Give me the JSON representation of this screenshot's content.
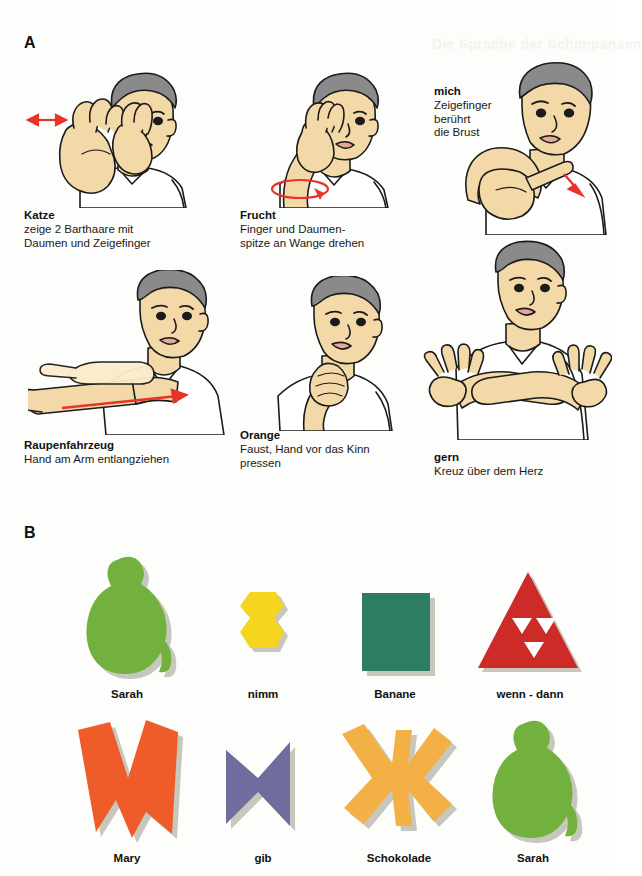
{
  "figure": {
    "panel_a_letter": "A",
    "panel_b_letter": "B",
    "ghost_text": "Die Sprache der Schimpansen"
  },
  "colors": {
    "skin": "#f4d9a8",
    "skin_shadow": "#e8c489",
    "hair": "#8a8a8a",
    "hair_dark": "#6e6e6e",
    "shirt": "#ffffff",
    "outline": "#1b1b1b",
    "arrow_red": "#e8322a",
    "green": "#72b13e",
    "yellow": "#f5d520",
    "teal": "#2e7d62",
    "red": "#cc2b28",
    "orange_red": "#ef5c2a",
    "purple": "#6f6d9e",
    "amber": "#f5b councilman"
  },
  "panel_a": {
    "signs": [
      {
        "id": "katze",
        "term": "Katze",
        "description": "zeige 2 Barthaare mit\nDaumen und Zeigefinger",
        "desc_lines": [
          "zeige 2 Barthaare mit",
          "Daumen und Zeigefinger"
        ],
        "arrow": "double-headed-left-arrow"
      },
      {
        "id": "frucht",
        "term": "Frucht",
        "description": "Finger und Daumen-\nspitze an Wange drehen",
        "desc_lines": [
          "Finger und Daumen-",
          "spitze an Wange drehen"
        ],
        "arrow": "rotation-ellipse"
      },
      {
        "id": "mich",
        "term": "mich",
        "description": "Zeigefinger\nberührt\ndie Brust",
        "desc_lines": [
          "Zeigefinger",
          "berührt",
          "die Brust"
        ],
        "arrow": "short-down-arrow",
        "caption_position": "above-left"
      },
      {
        "id": "raupenfahrzeug",
        "term": "Raupenfahrzeug",
        "description": "Hand am Arm entlangziehen",
        "desc_lines": [
          "Hand am Arm entlangziehen"
        ],
        "arrow": "long-right-arrow"
      },
      {
        "id": "orange",
        "term": "Orange",
        "description": "Faust, Hand vor das Kinn\npressen",
        "desc_lines": [
          "Faust, Hand vor das Kinn",
          "pressen"
        ],
        "arrow": "none"
      },
      {
        "id": "gern",
        "term": "gern",
        "description": "Kreuz über dem Herz",
        "desc_lines": [
          "Kreuz über dem Herz"
        ],
        "arrow": "none"
      }
    ]
  },
  "panel_b": {
    "tokens": [
      {
        "id": "sarah-1",
        "label": "Sarah",
        "shape": "pear-animal",
        "color": "#72b13e"
      },
      {
        "id": "nimm",
        "label": "nimm",
        "shape": "double-hexagon",
        "color": "#f5d520"
      },
      {
        "id": "banane",
        "label": "Banane",
        "shape": "square",
        "color": "#2e7d62"
      },
      {
        "id": "wenn-dann",
        "label": "wenn - dann",
        "shape": "sierpinski-triangle",
        "color": "#cc2b28"
      },
      {
        "id": "mary",
        "label": "Mary",
        "shape": "jagged-m",
        "color": "#ef5c2a"
      },
      {
        "id": "gib",
        "label": "gib",
        "shape": "bowtie",
        "color": "#6f6d9e"
      },
      {
        "id": "schokolade",
        "label": "Schokolade",
        "shape": "asterisk-x",
        "color": "#f3b044"
      },
      {
        "id": "sarah-2",
        "label": "Sarah",
        "shape": "pear-animal",
        "color": "#72b13e"
      }
    ]
  }
}
